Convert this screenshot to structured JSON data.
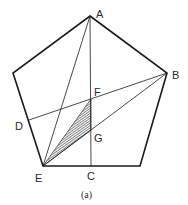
{
  "figure": {
    "caption": "(a)",
    "shape": "regular pentagon",
    "labels": {
      "A": "A",
      "B": "B",
      "C": "C",
      "D": "D",
      "E": "E",
      "F": "F",
      "G": "G"
    },
    "colors": {
      "stroke": "#1a1a1a",
      "hatch": "#333333",
      "background": "#ffffff"
    },
    "segments": [
      "AC",
      "AE",
      "BD",
      "BE",
      "outline"
    ],
    "shaded_region": "triangle EFG (hatched)"
  }
}
